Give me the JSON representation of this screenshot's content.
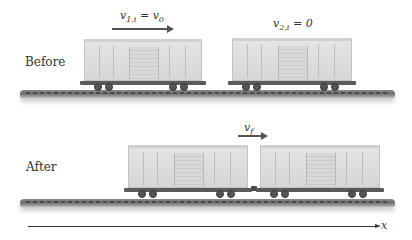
{
  "before": {
    "label": "Before",
    "car1_velocity": {
      "symbol": "v",
      "subscript": "1,i",
      "rhs_symbol": "v",
      "rhs_subscript": "0",
      "equals": " = "
    },
    "car2_velocity": {
      "symbol": "v",
      "subscript": "2,i",
      "equals": " = ",
      "rhs": "0"
    }
  },
  "after": {
    "label": "After",
    "final_velocity": {
      "symbol": "v",
      "subscript": "f"
    }
  },
  "axis": {
    "label": "x"
  }
}
